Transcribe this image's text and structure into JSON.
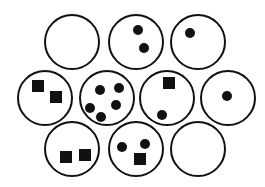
{
  "diagram": {
    "background": "#ffffff",
    "stroke_color": "#111111",
    "fill_color": "#111111",
    "circle_radius": 27,
    "circles": [
      {
        "id": "r1c1",
        "cx": 72,
        "cy": 42,
        "dots": [],
        "squares": []
      },
      {
        "id": "r1c2",
        "cx": 136,
        "cy": 42,
        "dots": [
          [
            138,
            30
          ],
          [
            144,
            48
          ]
        ],
        "squares": []
      },
      {
        "id": "r1c3",
        "cx": 198,
        "cy": 42,
        "dots": [
          [
            190,
            33
          ]
        ],
        "squares": []
      },
      {
        "id": "r2c1",
        "cx": 45,
        "cy": 98,
        "dots": [],
        "squares": [
          [
            38,
            86
          ],
          [
            56,
            97
          ]
        ]
      },
      {
        "id": "r2c2",
        "cx": 107,
        "cy": 98,
        "dots": [
          [
            100,
            90
          ],
          [
            119,
            88
          ],
          [
            90,
            108
          ],
          [
            116,
            105
          ],
          [
            101,
            117
          ]
        ],
        "squares": []
      },
      {
        "id": "r2c3",
        "cx": 167,
        "cy": 98,
        "dots": [
          [
            162,
            115
          ]
        ],
        "squares": [
          [
            169,
            83
          ]
        ]
      },
      {
        "id": "r2c4",
        "cx": 228,
        "cy": 98,
        "dots": [
          [
            227,
            96
          ]
        ],
        "squares": []
      },
      {
        "id": "r3c1",
        "cx": 72,
        "cy": 149,
        "dots": [],
        "squares": [
          [
            66,
            157
          ],
          [
            85,
            155
          ]
        ]
      },
      {
        "id": "r3c2",
        "cx": 136,
        "cy": 149,
        "dots": [
          [
            122,
            147
          ],
          [
            145,
            144
          ]
        ],
        "squares": [
          [
            140,
            159
          ]
        ]
      },
      {
        "id": "r3c3",
        "cx": 198,
        "cy": 149,
        "dots": [],
        "squares": []
      }
    ],
    "dot_radius": 5,
    "square_size": 12
  }
}
